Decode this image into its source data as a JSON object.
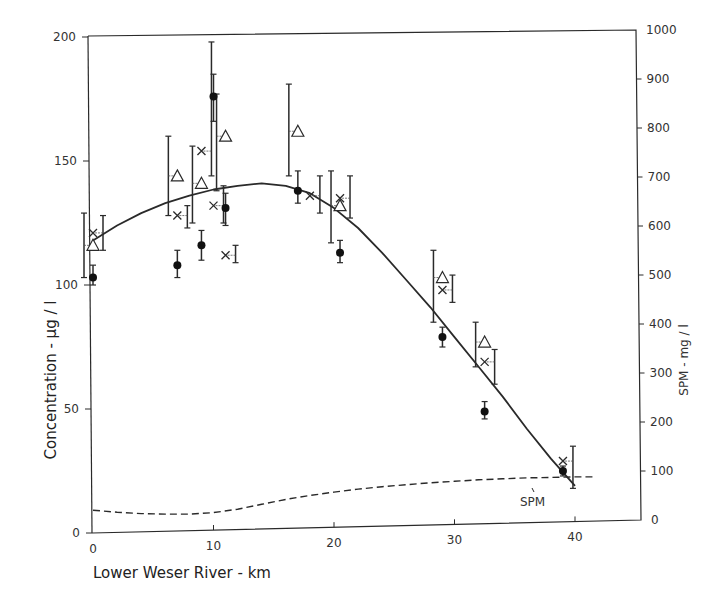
{
  "chart_data": {
    "type": "scatter",
    "title": "",
    "xlabel": "Lower Weser River - km",
    "ylabel": "Concentration - µg / l",
    "y2label": "SPM - mg / l",
    "xlim": [
      0,
      45
    ],
    "ylim": [
      0,
      200
    ],
    "y2lim": [
      0,
      1000
    ],
    "x_ticks": [
      "0",
      "10",
      "20",
      "30",
      "40"
    ],
    "y_ticks": [
      "0",
      "50",
      "100",
      "150",
      "200"
    ],
    "y2_ticks": [
      "0",
      "100",
      "200",
      "300",
      "400",
      "500",
      "600",
      "700",
      "800",
      "900",
      "1000"
    ],
    "grid": false,
    "legend": "none",
    "annotations": [
      "SPM"
    ],
    "series": [
      {
        "name": "filled-circle",
        "marker": "circle-filled",
        "points": [
          {
            "x": 0,
            "y": 103,
            "err": [
              100,
              108
            ]
          },
          {
            "x": 7,
            "y": 108,
            "err": [
              103,
              114
            ]
          },
          {
            "x": 9,
            "y": 116,
            "err": [
              110,
              122
            ]
          },
          {
            "x": 10,
            "y": 176,
            "err": [
              166,
              185
            ]
          },
          {
            "x": 11,
            "y": 131,
            "err": [
              124,
              137
            ]
          },
          {
            "x": 17,
            "y": 138,
            "err": [
              133,
              146
            ]
          },
          {
            "x": 20.5,
            "y": 113,
            "err": [
              109,
              118
            ]
          },
          {
            "x": 29,
            "y": 79,
            "err": [
              75,
              83
            ]
          },
          {
            "x": 32.5,
            "y": 49,
            "err": [
              46,
              53
            ]
          },
          {
            "x": 39,
            "y": 25,
            "err": [
              23,
              27
            ]
          }
        ]
      },
      {
        "name": "open-triangle",
        "marker": "triangle-open",
        "points": [
          {
            "x": 0,
            "y": 116,
            "err": [
              103,
              129
            ]
          },
          {
            "x": 7,
            "y": 144,
            "err": [
              128,
              160
            ]
          },
          {
            "x": 9,
            "y": 141,
            "err": [
              125,
              156
            ]
          },
          {
            "x": 11,
            "y": 160,
            "err": [
              138,
              177
            ]
          },
          {
            "x": 17,
            "y": 162,
            "err": [
              144,
              181
            ]
          },
          {
            "x": 20.5,
            "y": 132,
            "err": [
              117,
              146
            ]
          },
          {
            "x": 29,
            "y": 103,
            "err": [
              85,
              114
            ]
          },
          {
            "x": 32.5,
            "y": 77,
            "err": [
              67,
              85
            ]
          }
        ]
      },
      {
        "name": "cross",
        "marker": "x",
        "points": [
          {
            "x": 0,
            "y": 121,
            "err": [
              114,
              128
            ]
          },
          {
            "x": 7,
            "y": 128,
            "err": [
              123,
              132
            ]
          },
          {
            "x": 9,
            "y": 154,
            "err": [
              144,
              198
            ]
          },
          {
            "x": 10,
            "y": 132,
            "err": [
              125,
              140
            ]
          },
          {
            "x": 11,
            "y": 112,
            "err": [
              109,
              116
            ]
          },
          {
            "x": 18,
            "y": 136,
            "err": [
              129,
              144
            ]
          },
          {
            "x": 20.5,
            "y": 135,
            "err": [
              127,
              144
            ]
          },
          {
            "x": 29,
            "y": 98,
            "err": [
              93,
              104
            ]
          },
          {
            "x": 32.5,
            "y": 69,
            "err": [
              60,
              74
            ]
          },
          {
            "x": 39,
            "y": 29,
            "err": [
              18,
              35
            ]
          }
        ]
      },
      {
        "name": "fit-curve",
        "style": "solid-line",
        "x": [
          0,
          2,
          4,
          6,
          8,
          10,
          12,
          14,
          16,
          18,
          20,
          22,
          24,
          26,
          28,
          30,
          32,
          34,
          36,
          38,
          40
        ],
        "y": [
          118,
          124,
          129,
          133,
          136,
          138.5,
          140,
          141,
          140,
          137,
          131,
          123,
          113,
          102,
          91,
          79,
          67,
          55,
          42,
          30,
          19
        ]
      },
      {
        "name": "SPM",
        "axis": "y2",
        "style": "dashed-line",
        "x": [
          0,
          2,
          4,
          6,
          8,
          10,
          12,
          14,
          16,
          18,
          20,
          22,
          24,
          26,
          28,
          30,
          32,
          34,
          36,
          38,
          40,
          41.5
        ],
        "y": [
          20,
          16,
          13,
          12,
          12,
          15,
          22,
          32,
          42,
          50,
          57,
          63,
          68,
          72,
          76,
          79,
          82,
          84,
          86,
          87,
          88,
          88
        ]
      }
    ]
  }
}
